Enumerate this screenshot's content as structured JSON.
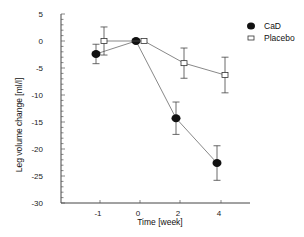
{
  "chart_data": {
    "type": "line",
    "title": "",
    "xlabel": "Time [week]",
    "ylabel": "Leg volume change [ml/l]",
    "ylim": [
      -30,
      5
    ],
    "yticks": [
      5,
      0,
      -5,
      -10,
      -15,
      -20,
      -25,
      -30
    ],
    "xticks": [
      -1,
      0,
      2,
      4
    ],
    "x_positions_note": "tick spacing is uniform per category",
    "grid": false,
    "legend_position": "upper right",
    "series": [
      {
        "name": "CaD",
        "marker": "filled-circle",
        "x": [
          -1,
          0,
          2,
          4
        ],
        "values": [
          -2.4,
          0,
          -14.3,
          -22.6
        ],
        "error": [
          1.8,
          0,
          3.0,
          3.2
        ]
      },
      {
        "name": "Placebo",
        "marker": "open-square",
        "x": [
          -1,
          0,
          2,
          4
        ],
        "values": [
          0,
          0,
          -4.1,
          -6.3
        ],
        "error": [
          2.6,
          0,
          2.8,
          3.3
        ]
      }
    ]
  },
  "legend": {
    "items": [
      {
        "label": "CaD"
      },
      {
        "label": "Placebo"
      }
    ]
  }
}
